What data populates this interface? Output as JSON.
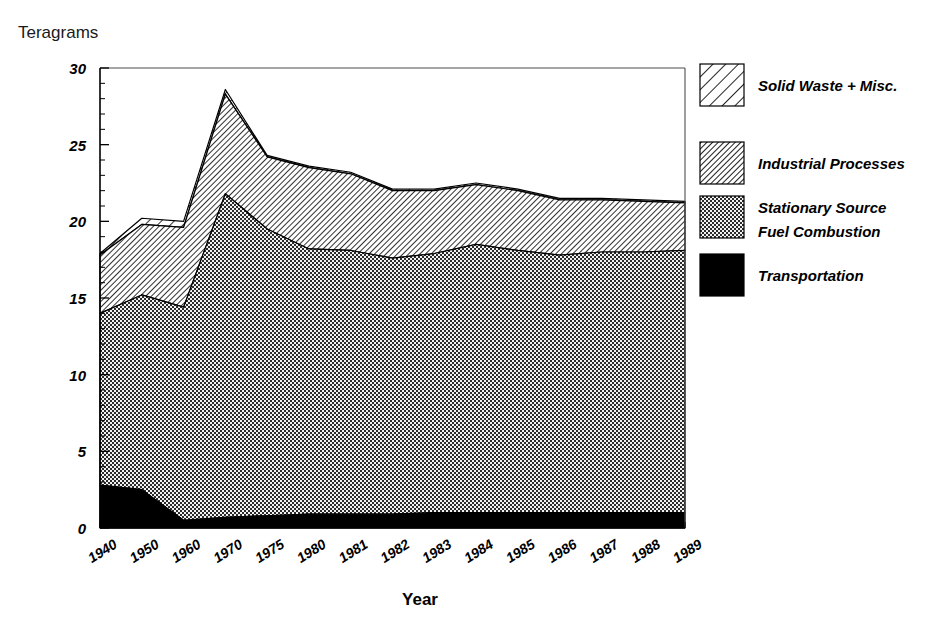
{
  "chart_data": {
    "type": "area",
    "title": "",
    "subtitle": "",
    "xlabel": "Year",
    "ylabel": "Teragrams",
    "stacked": true,
    "grid": false,
    "legend_position": "right",
    "xlim_categories": true,
    "ylim": [
      0,
      30
    ],
    "yticks": [
      0,
      5,
      10,
      15,
      20,
      25,
      30
    ],
    "ytick_labels": [
      "0",
      "5",
      "10",
      "15",
      "20",
      "25",
      "30"
    ],
    "y_minor_tick_step": 1,
    "categories": [
      "1940",
      "1950",
      "1960",
      "1970",
      "1975",
      "1980",
      "1981",
      "1982",
      "1983",
      "1984",
      "1985",
      "1986",
      "1987",
      "1988",
      "1989"
    ],
    "series": [
      {
        "name": "Transportation",
        "fill": "solid-black",
        "color": "#000000",
        "values": [
          2.8,
          2.5,
          0.5,
          0.7,
          0.8,
          0.9,
          0.9,
          0.9,
          1.0,
          1.0,
          1.0,
          1.0,
          1.0,
          1.0,
          1.0
        ]
      },
      {
        "name": "Stationary Source Fuel Combustion",
        "fill": "checker-dark",
        "color": "#666666",
        "values": [
          11.2,
          12.7,
          13.9,
          21.1,
          18.7,
          17.3,
          17.2,
          16.7,
          16.9,
          17.5,
          17.1,
          16.8,
          17.0,
          17.0,
          17.1
        ]
      },
      {
        "name": "Industrial Processes",
        "fill": "diagonal-hatch",
        "color": "#b3b3b3",
        "values": [
          3.8,
          4.6,
          5.2,
          6.5,
          4.7,
          5.3,
          5.0,
          4.4,
          4.1,
          3.9,
          3.9,
          3.6,
          3.4,
          3.3,
          3.1
        ]
      },
      {
        "name": "Solid Waste + Misc.",
        "fill": "wide-hatch",
        "color": "#ffffff",
        "values": [
          0.1,
          0.4,
          0.4,
          0.3,
          0.1,
          0.1,
          0.1,
          0.1,
          0.1,
          0.1,
          0.1,
          0.1,
          0.1,
          0.1,
          0.1
        ]
      }
    ],
    "totals": [
      17.9,
      20.2,
      20.0,
      28.6,
      24.3,
      23.6,
      23.2,
      22.1,
      22.1,
      22.5,
      22.1,
      21.5,
      21.5,
      21.4,
      21.3
    ]
  },
  "legend": {
    "items": [
      {
        "label": "Solid Waste + Misc.",
        "pattern": "wide-hatch"
      },
      {
        "label": "Industrial Processes",
        "pattern": "diagonal-hatch"
      },
      {
        "label": "Stationary Source",
        "label2": "Fuel Combustion",
        "pattern": "checker-dark"
      },
      {
        "label": "Transportation",
        "pattern": "solid-black"
      }
    ]
  },
  "axes": {
    "y_axis_title": "Teragrams",
    "x_axis_title": "Year"
  }
}
